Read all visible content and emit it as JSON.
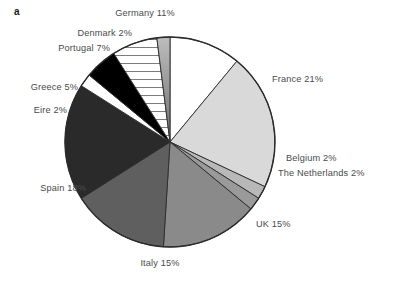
{
  "figure": {
    "panel_label": "a",
    "background_color": "#ffffff",
    "text_color": "#4a4a4a"
  },
  "chart_data": {
    "type": "pie",
    "title": "",
    "subtitle": "",
    "xlabel": "",
    "ylabel": "",
    "legend_position": "none",
    "grid": false,
    "total_percent": 100,
    "start_angle_deg": 0,
    "direction": "clockwise",
    "categories": [
      "Germany",
      "France",
      "Belgium",
      "The Netherlands",
      "UK",
      "Italy",
      "Spain",
      "Eire",
      "Greece",
      "Portugal",
      "Denmark"
    ],
    "values": [
      11,
      21,
      2,
      2,
      15,
      15,
      18,
      2,
      5,
      7,
      2
    ],
    "slices": [
      {
        "label": "Germany 11%",
        "name": "Germany",
        "value": 11,
        "fill": "#ffffff",
        "pattern": "solid",
        "label_x": 145,
        "label_y": 8,
        "label_align": "center"
      },
      {
        "label": "France 21%",
        "name": "France",
        "value": 21,
        "fill": "#d9d9d9",
        "pattern": "solid",
        "label_x": 272,
        "label_y": 74,
        "label_align": "right"
      },
      {
        "label": "Belgium 2%",
        "name": "Belgium",
        "value": 2,
        "fill": "#b8b8b8",
        "pattern": "solid",
        "label_x": 286,
        "label_y": 153,
        "label_align": "right"
      },
      {
        "label": "The Netherlands 2%",
        "name": "The Netherlands",
        "value": 2,
        "fill": "#9a9a9a",
        "pattern": "solid",
        "label_x": 278,
        "label_y": 168,
        "label_align": "right"
      },
      {
        "label": "UK 15%",
        "name": "UK",
        "value": 15,
        "fill": "#8a8a8a",
        "pattern": "solid",
        "label_x": 256,
        "label_y": 219,
        "label_align": "right"
      },
      {
        "label": "Italy 15%",
        "name": "Italy",
        "value": 15,
        "fill": "#5f5f5f",
        "pattern": "solid",
        "label_x": 160,
        "label_y": 258,
        "label_align": "center"
      },
      {
        "label": "Spain 18%",
        "name": "Spain",
        "value": 18,
        "fill": "#2a2a2a",
        "pattern": "solid",
        "label_x": 86,
        "label_y": 183,
        "label_align": "left"
      },
      {
        "label": "Eire 2%",
        "name": "Eire",
        "value": 2,
        "fill": "#ffffff",
        "pattern": "solid",
        "label_x": 67,
        "label_y": 105,
        "label_align": "left"
      },
      {
        "label": "Greece 5%",
        "name": "Greece",
        "value": 5,
        "fill": "#000000",
        "pattern": "solid",
        "label_x": 78,
        "label_y": 82,
        "label_align": "left"
      },
      {
        "label": "Portugal 7%",
        "name": "Portugal",
        "value": 7,
        "fill": "#ffffff",
        "pattern": "horizontal-lines",
        "label_x": 110,
        "label_y": 43,
        "label_align": "left"
      },
      {
        "label": "Denmark 2%",
        "name": "Denmark",
        "value": 2,
        "fill": "#8f8f8f",
        "pattern": "gradient",
        "label_x": 132,
        "label_y": 28,
        "label_align": "left"
      }
    ],
    "geometry": {
      "center_x": 170,
      "center_y": 142,
      "radius": 105,
      "outline_color": "#2b2b2b"
    }
  }
}
